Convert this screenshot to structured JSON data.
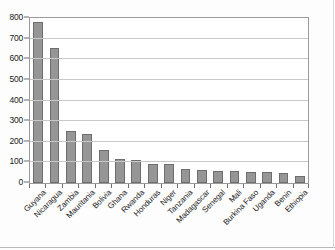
{
  "chart_data": {
    "type": "bar",
    "title": "",
    "subtitle": "",
    "xlabel": "",
    "ylabel": "",
    "ylim": [
      0,
      800
    ],
    "yticks": [
      0,
      100,
      200,
      300,
      400,
      500,
      600,
      700,
      800
    ],
    "ytick_labels": [
      "0",
      "100",
      "200",
      "300",
      "400",
      "500",
      "600",
      "700",
      "800"
    ],
    "grid": true,
    "legend": false,
    "legend_position": "none",
    "bar_color": "#969696",
    "bar_edge_color": "#6e6e6e",
    "gridline_color": "#c8c8c8",
    "axis_color": "#9a9a9a",
    "categories": [
      "Guyana",
      "Nicaragua",
      "Zambia",
      "Mauritania",
      "Bolivia",
      "Ghana",
      "Rwanda",
      "Honduras",
      "Niger",
      "Tanzania",
      "Madagascar",
      "Senegal",
      "Mali",
      "Burkina Faso",
      "Uganda",
      "Benin",
      "Ethiopia"
    ],
    "values": [
      780,
      655,
      253,
      236,
      160,
      115,
      110,
      93,
      90,
      68,
      63,
      58,
      57,
      52,
      52,
      47,
      35
    ]
  }
}
